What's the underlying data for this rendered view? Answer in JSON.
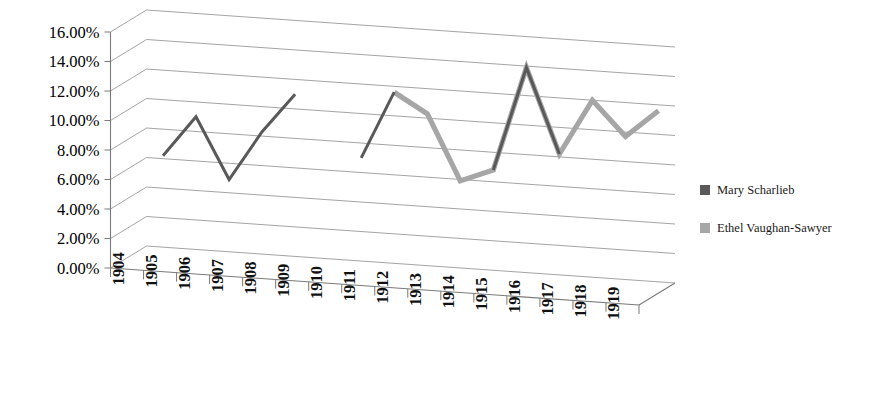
{
  "chart_data": {
    "type": "line",
    "title": "",
    "subtitle": "",
    "xlabel": "",
    "ylabel": "",
    "categories": [
      "1904",
      "1905",
      "1906",
      "1907",
      "1908",
      "1909",
      "1910",
      "1911",
      "1912",
      "1913",
      "1914",
      "1915",
      "1916",
      "1917",
      "1918",
      "1919"
    ],
    "ytick_labels": [
      "0.00%",
      "2.00%",
      "4.00%",
      "6.00%",
      "8.00%",
      "10.00%",
      "12.00%",
      "14.00%",
      "16.00%"
    ],
    "ytick_values": [
      0,
      2,
      4,
      6,
      8,
      10,
      12,
      14,
      16
    ],
    "ylim": [
      0,
      16
    ],
    "grid": true,
    "legend_position": "right",
    "perspective_3d": true,
    "series": [
      {
        "name": "Mary Scharlieb",
        "color": "#595959",
        "values": [
          6.2,
          9.0,
          4.9,
          8.3,
          11.0,
          null,
          7.0,
          11.6,
          null,
          null,
          6.8,
          13.9,
          8.2,
          null,
          null,
          null
        ]
      },
      {
        "name": "Ethel Vaughan-Sawyer",
        "color": "#A6A6A6",
        "values": [
          null,
          null,
          null,
          null,
          null,
          null,
          null,
          11.6,
          10.3,
          5.9,
          6.8,
          13.9,
          8.2,
          12.0,
          9.7,
          11.6
        ]
      }
    ],
    "series_extra_note": ""
  },
  "legend": {
    "items": [
      {
        "label": "Mary Scharlieb",
        "color": "#595959"
      },
      {
        "label": "Ethel Vaughan-Sawyer",
        "color": "#A6A6A6"
      }
    ]
  },
  "axes": {
    "y": {
      "labels": [
        "16.00%",
        "14.00%",
        "12.00%",
        "10.00%",
        "8.00%",
        "6.00%",
        "4.00%",
        "2.00%",
        "0.00%"
      ]
    },
    "x": {
      "labels": [
        "1904",
        "1905",
        "1906",
        "1907",
        "1908",
        "1909",
        "1910",
        "1911",
        "1912",
        "1913",
        "1914",
        "1915",
        "1916",
        "1917",
        "1918",
        "1919"
      ]
    }
  },
  "colors": {
    "series_dark": "#595959",
    "series_light": "#A6A6A6",
    "gridline": "#9a9a9a",
    "axis": "#7a7a7a",
    "background": "#ffffff",
    "text": "#000000"
  }
}
